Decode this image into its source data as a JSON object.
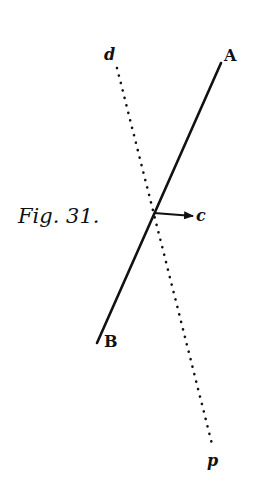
{
  "figure": {
    "caption": "Fig. 31.",
    "labels": {
      "A": "A",
      "B": "B",
      "c": "c",
      "d": "d",
      "p": "p"
    },
    "lines": {
      "solid_AB": {
        "x1": 221,
        "y1": 63,
        "x2": 97,
        "y2": 343,
        "style": "solid"
      },
      "dotted_dp": {
        "x1": 117,
        "y1": 68,
        "x2": 213,
        "y2": 448,
        "style": "dotted"
      },
      "arrow_c": {
        "x1": 154,
        "y1": 213,
        "x2": 193,
        "y2": 216,
        "style": "arrow"
      }
    },
    "ink_color": "#111111",
    "background": "#ffffff"
  }
}
